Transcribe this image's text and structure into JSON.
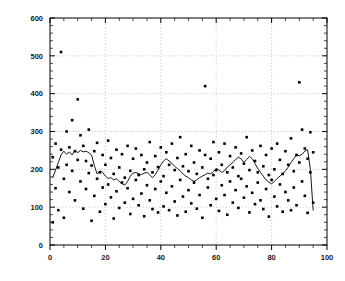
{
  "chart_data": {
    "type": "scatter",
    "title": "",
    "xlabel": "",
    "ylabel": "",
    "xlim": [
      0,
      100
    ],
    "ylim": [
      0,
      600
    ],
    "grid": true,
    "legend": null,
    "x_ticks_major": [
      0,
      20,
      40,
      60,
      80,
      100
    ],
    "x_tick_labels": [
      "0",
      "20",
      "40",
      "60",
      "80",
      "100"
    ],
    "x_minor_step": 5,
    "y_ticks_major": [
      0,
      100,
      200,
      300,
      400,
      500,
      600
    ],
    "y_tick_labels": [
      "0",
      "100",
      "200",
      "300",
      "400",
      "500",
      "600"
    ],
    "y_minor_step": 20,
    "series": [
      {
        "name": "observations",
        "type": "scatter",
        "marker": "square",
        "color": "#000000",
        "points": [
          [
            1,
            232
          ],
          [
            1,
            60
          ],
          [
            2,
            268
          ],
          [
            2,
            150
          ],
          [
            3,
            205
          ],
          [
            3,
            92
          ],
          [
            4,
            510
          ],
          [
            4,
            252
          ],
          [
            5,
            175
          ],
          [
            5,
            72
          ],
          [
            6,
            300
          ],
          [
            6,
            212
          ],
          [
            7,
            258
          ],
          [
            7,
            140
          ],
          [
            8,
            330
          ],
          [
            8,
            196
          ],
          [
            9,
            248
          ],
          [
            9,
            118
          ],
          [
            10,
            385
          ],
          [
            10,
            225
          ],
          [
            11,
            290
          ],
          [
            11,
            168
          ],
          [
            12,
            262
          ],
          [
            12,
            96
          ],
          [
            13,
            222
          ],
          [
            13,
            148
          ],
          [
            14,
            305
          ],
          [
            14,
            190
          ],
          [
            15,
            210
          ],
          [
            15,
            64
          ],
          [
            16,
            248
          ],
          [
            16,
            130
          ],
          [
            17,
            270
          ],
          [
            17,
            175
          ],
          [
            18,
            192
          ],
          [
            18,
            88
          ],
          [
            19,
            238
          ],
          [
            19,
            152
          ],
          [
            20,
            212
          ],
          [
            20,
            108
          ],
          [
            21,
            276
          ],
          [
            21,
            160
          ],
          [
            22,
            230
          ],
          [
            22,
            126
          ],
          [
            23,
            188
          ],
          [
            23,
            70
          ],
          [
            24,
            252
          ],
          [
            24,
            142
          ],
          [
            25,
            205
          ],
          [
            25,
            98
          ],
          [
            26,
            240
          ],
          [
            26,
            165
          ],
          [
            27,
            178
          ],
          [
            27,
            112
          ],
          [
            28,
            262
          ],
          [
            28,
            150
          ],
          [
            29,
            196
          ],
          [
            29,
            82
          ],
          [
            30,
            228
          ],
          [
            30,
            122
          ],
          [
            31,
            255
          ],
          [
            31,
            172
          ],
          [
            32,
            185
          ],
          [
            32,
            105
          ],
          [
            33,
            238
          ],
          [
            33,
            136
          ],
          [
            34,
            200
          ],
          [
            34,
            76
          ],
          [
            35,
            218
          ],
          [
            35,
            158
          ],
          [
            36,
            272
          ],
          [
            36,
            118
          ],
          [
            37,
            192
          ],
          [
            37,
            95
          ],
          [
            38,
            235
          ],
          [
            38,
            148
          ],
          [
            39,
            206
          ],
          [
            39,
            86
          ],
          [
            40,
            258
          ],
          [
            40,
            168
          ],
          [
            41,
            182
          ],
          [
            41,
            102
          ],
          [
            42,
            245
          ],
          [
            42,
            138
          ],
          [
            43,
            212
          ],
          [
            43,
            92
          ],
          [
            44,
            268
          ],
          [
            44,
            155
          ],
          [
            45,
            198
          ],
          [
            45,
            115
          ],
          [
            46,
            230
          ],
          [
            46,
            78
          ],
          [
            47,
            285
          ],
          [
            47,
            172
          ],
          [
            48,
            208
          ],
          [
            48,
            128
          ],
          [
            49,
            240
          ],
          [
            49,
            88
          ],
          [
            50,
            195
          ],
          [
            50,
            145
          ],
          [
            51,
            262
          ],
          [
            51,
            110
          ],
          [
            52,
            218
          ],
          [
            52,
            165
          ],
          [
            53,
            188
          ],
          [
            53,
            96
          ],
          [
            54,
            250
          ],
          [
            54,
            132
          ],
          [
            55,
            205
          ],
          [
            55,
            72
          ],
          [
            56,
            420
          ],
          [
            56,
            238
          ],
          [
            57,
            175
          ],
          [
            57,
            152
          ],
          [
            58,
            228
          ],
          [
            58,
            105
          ],
          [
            59,
            272
          ],
          [
            59,
            185
          ],
          [
            60,
            198
          ],
          [
            60,
            122
          ],
          [
            61,
            245
          ],
          [
            61,
            90
          ],
          [
            62,
            212
          ],
          [
            62,
            158
          ],
          [
            63,
            268
          ],
          [
            63,
            132
          ],
          [
            64,
            192
          ],
          [
            64,
            80
          ],
          [
            65,
            235
          ],
          [
            65,
            168
          ],
          [
            66,
            205
          ],
          [
            66,
            112
          ],
          [
            67,
            258
          ],
          [
            67,
            145
          ],
          [
            68,
            182
          ],
          [
            68,
            98
          ],
          [
            69,
            242
          ],
          [
            69,
            175
          ],
          [
            70,
            215
          ],
          [
            70,
            125
          ],
          [
            71,
            285
          ],
          [
            71,
            155
          ],
          [
            72,
            198
          ],
          [
            72,
            86
          ],
          [
            73,
            250
          ],
          [
            73,
            138
          ],
          [
            74,
            222
          ],
          [
            74,
            108
          ],
          [
            75,
            192
          ],
          [
            75,
            165
          ],
          [
            76,
            262
          ],
          [
            76,
            118
          ],
          [
            77,
            208
          ],
          [
            77,
            95
          ],
          [
            78,
            238
          ],
          [
            78,
            148
          ],
          [
            79,
            185
          ],
          [
            79,
            75
          ],
          [
            80,
            255
          ],
          [
            80,
            172
          ],
          [
            81,
            200
          ],
          [
            81,
            128
          ],
          [
            82,
            268
          ],
          [
            82,
            102
          ],
          [
            83,
            225
          ],
          [
            83,
            160
          ],
          [
            84,
            188
          ],
          [
            84,
            88
          ],
          [
            85,
            248
          ],
          [
            85,
            140
          ],
          [
            86,
            212
          ],
          [
            86,
            118
          ],
          [
            87,
            282
          ],
          [
            87,
            92
          ],
          [
            88,
            195
          ],
          [
            88,
            152
          ],
          [
            89,
            238
          ],
          [
            89,
            105
          ],
          [
            90,
            430
          ],
          [
            90,
            218
          ],
          [
            91,
            305
          ],
          [
            91,
            168
          ],
          [
            92,
            255
          ],
          [
            92,
            130
          ],
          [
            93,
            228
          ],
          [
            93,
            85
          ],
          [
            94,
            298
          ],
          [
            94,
            192
          ],
          [
            95,
            245
          ],
          [
            95,
            112
          ]
        ]
      },
      {
        "name": "moving-average",
        "type": "line",
        "color": "#000000",
        "points": [
          [
            1,
            178
          ],
          [
            2,
            198
          ],
          [
            3,
            218
          ],
          [
            4,
            238
          ],
          [
            5,
            248
          ],
          [
            6,
            240
          ],
          [
            7,
            246
          ],
          [
            8,
            238
          ],
          [
            9,
            250
          ],
          [
            10,
            244
          ],
          [
            11,
            250
          ],
          [
            12,
            246
          ],
          [
            13,
            248
          ],
          [
            14,
            244
          ],
          [
            15,
            238
          ],
          [
            16,
            210
          ],
          [
            17,
            188
          ],
          [
            18,
            196
          ],
          [
            19,
            192
          ],
          [
            20,
            182
          ],
          [
            21,
            176
          ],
          [
            22,
            178
          ],
          [
            23,
            172
          ],
          [
            24,
            175
          ],
          [
            25,
            168
          ],
          [
            26,
            162
          ],
          [
            27,
            158
          ],
          [
            28,
            168
          ],
          [
            29,
            182
          ],
          [
            30,
            190
          ],
          [
            31,
            192
          ],
          [
            32,
            188
          ],
          [
            33,
            186
          ],
          [
            34,
            190
          ],
          [
            35,
            192
          ],
          [
            36,
            185
          ],
          [
            37,
            178
          ],
          [
            38,
            186
          ],
          [
            39,
            198
          ],
          [
            40,
            212
          ],
          [
            41,
            222
          ],
          [
            42,
            228
          ],
          [
            43,
            222
          ],
          [
            44,
            216
          ],
          [
            45,
            208
          ],
          [
            46,
            202
          ],
          [
            47,
            196
          ],
          [
            48,
            188
          ],
          [
            49,
            182
          ],
          [
            50,
            178
          ],
          [
            51,
            172
          ],
          [
            52,
            168
          ],
          [
            53,
            172
          ],
          [
            54,
            178
          ],
          [
            55,
            182
          ],
          [
            56,
            186
          ],
          [
            57,
            190
          ],
          [
            58,
            188
          ],
          [
            59,
            194
          ],
          [
            60,
            202
          ],
          [
            61,
            198
          ],
          [
            62,
            192
          ],
          [
            63,
            196
          ],
          [
            64,
            206
          ],
          [
            65,
            212
          ],
          [
            66,
            218
          ],
          [
            67,
            226
          ],
          [
            68,
            232
          ],
          [
            69,
            228
          ],
          [
            70,
            218
          ],
          [
            71,
            226
          ],
          [
            72,
            234
          ],
          [
            73,
            228
          ],
          [
            74,
            216
          ],
          [
            75,
            202
          ],
          [
            76,
            192
          ],
          [
            77,
            182
          ],
          [
            78,
            172
          ],
          [
            79,
            166
          ],
          [
            80,
            162
          ],
          [
            81,
            168
          ],
          [
            82,
            176
          ],
          [
            83,
            182
          ],
          [
            84,
            188
          ],
          [
            85,
            196
          ],
          [
            86,
            206
          ],
          [
            87,
            218
          ],
          [
            88,
            228
          ],
          [
            89,
            238
          ],
          [
            90,
            236
          ],
          [
            91,
            240
          ],
          [
            92,
            248
          ],
          [
            93,
            252
          ],
          [
            94,
            200
          ],
          [
            95,
            92
          ]
        ]
      }
    ]
  },
  "style": {
    "axis_color": "#000000",
    "grid_color": "#b8b8b8",
    "marker_color": "#000000",
    "line_color": "#000000",
    "background": "#ffffff"
  }
}
